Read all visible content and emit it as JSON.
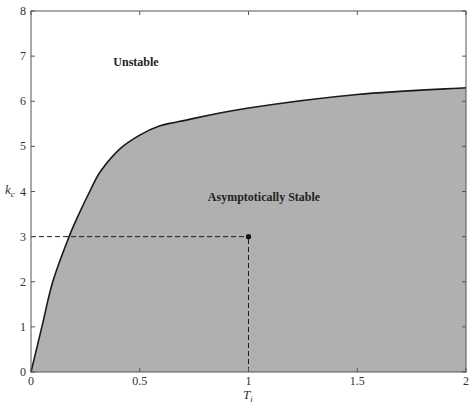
{
  "chart_data": {
    "type": "area",
    "title": "",
    "xlabel": "T_i",
    "ylabel": "k_c",
    "xlim": [
      0,
      2
    ],
    "ylim": [
      0,
      8
    ],
    "grid": false,
    "legend": null,
    "x_ticks": [
      "0",
      "0.5",
      "1",
      "1.5",
      "2"
    ],
    "y_ticks": [
      "0",
      "1",
      "2",
      "3",
      "4",
      "5",
      "6",
      "7",
      "8"
    ],
    "series": [
      {
        "name": "stability boundary",
        "x": [
          0,
          0.05,
          0.1,
          0.175,
          0.225,
          0.27,
          0.32,
          0.41,
          0.5,
          0.59,
          0.68,
          1.0,
          1.5,
          2.0
        ],
        "values": [
          0,
          1.0,
          2.0,
          3.0,
          3.55,
          4.0,
          4.45,
          4.95,
          5.25,
          5.45,
          5.55,
          5.85,
          6.15,
          6.3
        ]
      }
    ],
    "regions": [
      {
        "label": "Unstable",
        "location": "above curve"
      },
      {
        "label": "Asymptotically Stable",
        "location": "below curve",
        "fill": "#b0b0b0"
      }
    ],
    "annotations": [
      {
        "type": "point",
        "x": 1.0,
        "y": 3.0
      },
      {
        "type": "dashed-line",
        "from": [
          0,
          3.0
        ],
        "to": [
          1.0,
          3.0
        ]
      },
      {
        "type": "dashed-line",
        "from": [
          1.0,
          0
        ],
        "to": [
          1.0,
          3.0
        ]
      }
    ]
  },
  "labels": {
    "unstable": "Unstable",
    "stable": "Asymptotically Stable",
    "x_axis_main": "T",
    "x_axis_sub": "i",
    "y_axis_main": "k",
    "y_axis_sub": "c"
  },
  "colors": {
    "fill": "#b0b0b0",
    "curve": "#1a1a1a",
    "frame": "#555555"
  }
}
